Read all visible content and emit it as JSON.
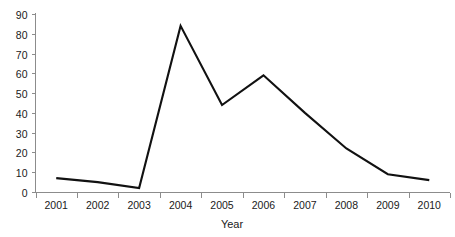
{
  "chart_data": {
    "type": "line",
    "title": "",
    "subtitle": "",
    "xlabel": "Year",
    "ylabel": "",
    "categories": [
      "2001",
      "2002",
      "2003",
      "2004",
      "2005",
      "2006",
      "2007",
      "2008",
      "2009",
      "2010"
    ],
    "x": [
      2001,
      2002,
      2003,
      2004,
      2005,
      2006,
      2007,
      2008,
      2009,
      2010
    ],
    "values": [
      7,
      5,
      2,
      84,
      44,
      59,
      40,
      22,
      9,
      6
    ],
    "series": [
      {
        "name": "",
        "values": [
          7,
          5,
          2,
          84,
          44,
          59,
          40,
          22,
          9,
          6
        ]
      }
    ],
    "ylim": [
      0,
      90
    ],
    "yticks": [
      0,
      10,
      20,
      30,
      40,
      50,
      60,
      70,
      80,
      90
    ],
    "ytick_labels": [
      "0",
      "10",
      "20",
      "30",
      "40",
      "50",
      "60",
      "70",
      "80",
      "90"
    ],
    "xtick_labels": [
      "2001",
      "2002",
      "2003",
      "2004",
      "2005",
      "2006",
      "2007",
      "2008",
      "2009",
      "2010"
    ],
    "grid": false,
    "legend": false,
    "legend_position": "none",
    "line_color": "#111111",
    "axis_color": "#8c8c8c",
    "background_color": "#ffffff",
    "annotations": []
  },
  "axes": {
    "x_axis_title": "Year"
  }
}
